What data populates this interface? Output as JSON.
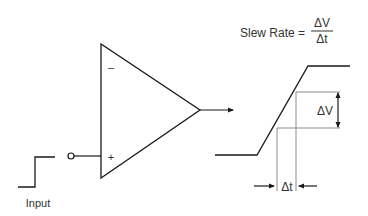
{
  "diagram": {
    "formula": {
      "label": "Slew Rate =",
      "numerator": "ΔV",
      "denominator": "Δt"
    },
    "opamp": {
      "inverting_symbol": "–",
      "noninverting_symbol": "+"
    },
    "input_label": "Input",
    "delta_v_label": "ΔV",
    "delta_t_label": "Δt",
    "colors": {
      "line": "#1a1a1a",
      "guide": "#8c8c8c",
      "text": "#333333"
    }
  }
}
